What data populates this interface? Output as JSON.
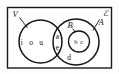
{
  "diagram": {
    "type": "venn",
    "universe": {
      "label": "ℰ",
      "shape": "rectangle"
    },
    "sets": [
      {
        "id": "V",
        "label": "V",
        "position": "left-circle"
      },
      {
        "id": "A",
        "label": "A",
        "position": "right-circle"
      },
      {
        "id": "B",
        "label": "B",
        "position": "inner-circle-of-A"
      }
    ],
    "regions": [
      {
        "id": "v-only",
        "members": "i o u"
      },
      {
        "id": "v-and-a",
        "members_top": "a",
        "members_bottom": "e"
      },
      {
        "id": "b-inner",
        "members": "b c"
      },
      {
        "id": "a-only",
        "members": "d"
      }
    ]
  }
}
